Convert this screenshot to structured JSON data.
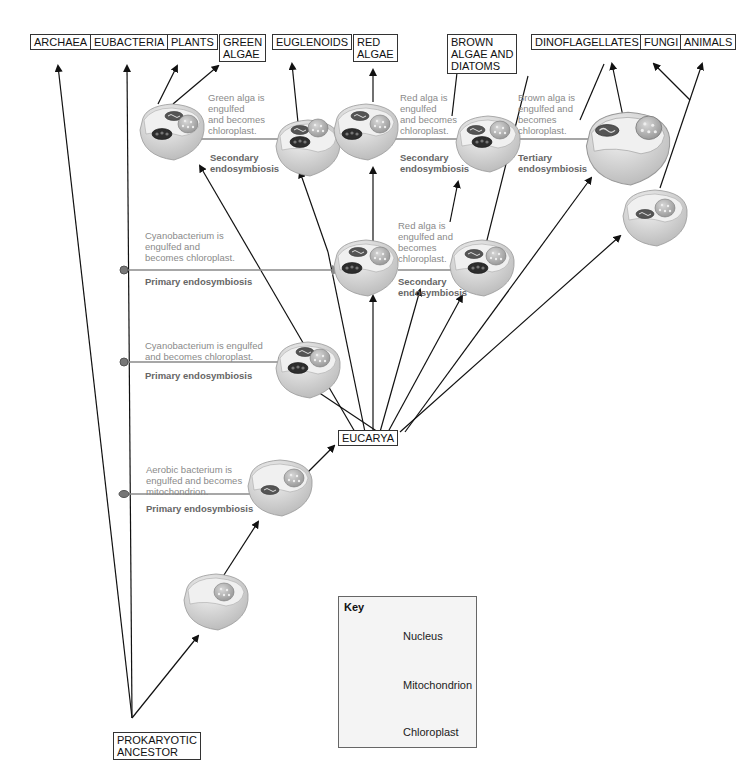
{
  "header": {
    "page_running_text": ""
  },
  "taxa": [
    {
      "id": "archaea",
      "label": "ARCHAEA"
    },
    {
      "id": "eubacteria",
      "label": "EUBACTERIA"
    },
    {
      "id": "plants",
      "label": "PLANTS"
    },
    {
      "id": "green-algae",
      "label": "GREEN\nALGAE"
    },
    {
      "id": "euglenoids",
      "label": "EUGLENOIDS"
    },
    {
      "id": "red-algae",
      "label": "RED\nALGAE"
    },
    {
      "id": "brown-algae-diatoms",
      "label": "BROWN\nALGAE AND\nDIATOMS"
    },
    {
      "id": "dinoflagellates",
      "label": "DINOFLAGELLATES"
    },
    {
      "id": "fungi",
      "label": "FUNGI"
    },
    {
      "id": "animals",
      "label": "ANIMALS"
    }
  ],
  "eucarya": "EUCARYA",
  "ancestor": "PROKARYOTIC\nANCESTOR",
  "events": [
    {
      "note": "Green alga is\nengulfed\nand becomes\nchloroplast.",
      "label": "Secondary\nendosymbiosis"
    },
    {
      "note": "Red alga is\nengulfed\nand becomes\nchloroplast.",
      "label": "Secondary\nendosymbiosis"
    },
    {
      "note": "Brown alga is\nengulfed and\nbecomes\nchloroplast.",
      "label": "Tertiary\nendosymbiosis"
    },
    {
      "note": "Cyanobacterium is\nengulfed and\nbecomes chloroplast.",
      "label": "Primary endosymbiosis"
    },
    {
      "note": "Red alga is\nengulfed and\nbecomes\nchloroplast.",
      "label": "Secondary\nendosymbiosis"
    },
    {
      "note": "Cyanobacterium is engulfed\nand becomes chloroplast.",
      "label": "Primary endosymbiosis"
    },
    {
      "note": "Aerobic bacterium is\nengulfed and becomes\nmitochondrion.",
      "label": "Primary endosymbiosis"
    }
  ],
  "key": {
    "title": "Key",
    "items": [
      {
        "icon": "nucleus-icon",
        "label": "Nucleus"
      },
      {
        "icon": "mitochondrion-icon",
        "label": "Mitochondrion"
      },
      {
        "icon": "chloroplast-icon",
        "label": "Chloroplast"
      }
    ]
  },
  "colors": {
    "line": "#111111",
    "transfer_line": "#8a8a8a",
    "cell_fill": "#e2e2e2",
    "cell_body": "#cfcfcf",
    "nucleus": "#b5b5b5",
    "chloroplast": "#333333"
  }
}
